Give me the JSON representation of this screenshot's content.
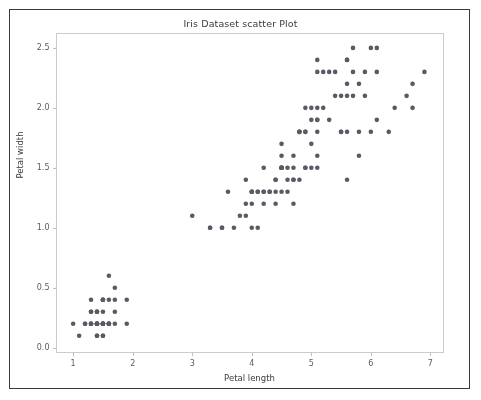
{
  "figure": {
    "title": "Iris Dataset scatter Plot",
    "background_color": "#ffffff",
    "frame_color": "#3a3a3a",
    "axes_spine_color": "#cccccc",
    "marker_color": "#5a5a64"
  },
  "chart_data": {
    "type": "scatter",
    "title": "Iris Dataset scatter Plot",
    "xlabel": "Petal length",
    "ylabel": "Petal width",
    "xlim": [
      0.72,
      7.22
    ],
    "ylim": [
      -0.04,
      2.62
    ],
    "xticks": [
      1,
      2,
      3,
      4,
      5,
      6,
      7
    ],
    "xtick_labels": [
      "1",
      "2",
      "3",
      "4",
      "5",
      "6",
      "7"
    ],
    "yticks": [
      0.0,
      0.5,
      1.0,
      1.5,
      2.0,
      2.5
    ],
    "ytick_labels": [
      "0.0",
      "0.5",
      "1.0",
      "1.5",
      "2.0",
      "2.5"
    ],
    "grid": false,
    "legend": null,
    "marker_color": "#5a5a64",
    "marker_size": 4.6,
    "n_points": 150,
    "x": [
      1.4,
      1.4,
      1.3,
      1.5,
      1.4,
      1.7,
      1.4,
      1.5,
      1.4,
      1.5,
      1.5,
      1.6,
      1.4,
      1.1,
      1.2,
      1.5,
      1.3,
      1.4,
      1.7,
      1.5,
      1.7,
      1.5,
      1.0,
      1.7,
      1.9,
      1.6,
      1.6,
      1.5,
      1.4,
      1.6,
      1.6,
      1.5,
      1.5,
      1.4,
      1.5,
      1.2,
      1.3,
      1.4,
      1.3,
      1.5,
      1.3,
      1.3,
      1.3,
      1.6,
      1.9,
      1.4,
      1.6,
      1.4,
      1.5,
      1.4,
      4.7,
      4.5,
      4.9,
      4.0,
      4.6,
      4.5,
      4.7,
      3.3,
      4.6,
      3.9,
      3.5,
      4.2,
      4.0,
      4.7,
      3.6,
      4.4,
      4.5,
      4.1,
      4.5,
      3.9,
      4.8,
      4.0,
      4.9,
      4.7,
      4.3,
      4.4,
      4.8,
      5.0,
      4.5,
      3.5,
      3.8,
      3.7,
      3.9,
      5.1,
      4.5,
      4.5,
      4.7,
      4.4,
      4.1,
      4.0,
      4.4,
      4.6,
      4.0,
      3.3,
      4.2,
      4.2,
      4.2,
      4.3,
      3.0,
      4.1,
      6.0,
      5.1,
      5.9,
      5.6,
      5.8,
      6.6,
      4.5,
      6.3,
      5.8,
      6.1,
      5.1,
      5.3,
      5.5,
      5.0,
      5.1,
      5.3,
      5.5,
      6.7,
      6.9,
      5.0,
      5.7,
      4.9,
      6.7,
      4.9,
      5.7,
      6.0,
      4.8,
      4.9,
      5.6,
      5.8,
      6.1,
      6.4,
      5.6,
      5.1,
      5.6,
      6.1,
      5.6,
      5.5,
      4.8,
      5.4,
      5.6,
      5.1,
      5.1,
      5.9,
      5.7,
      5.2,
      5.0,
      5.2,
      5.4,
      5.1
    ],
    "y": [
      0.2,
      0.2,
      0.2,
      0.2,
      0.2,
      0.4,
      0.3,
      0.2,
      0.2,
      0.1,
      0.2,
      0.2,
      0.1,
      0.1,
      0.2,
      0.4,
      0.4,
      0.3,
      0.3,
      0.3,
      0.2,
      0.4,
      0.2,
      0.5,
      0.2,
      0.2,
      0.4,
      0.2,
      0.2,
      0.2,
      0.2,
      0.4,
      0.1,
      0.2,
      0.2,
      0.2,
      0.2,
      0.1,
      0.2,
      0.2,
      0.3,
      0.3,
      0.2,
      0.6,
      0.4,
      0.3,
      0.2,
      0.2,
      0.2,
      0.2,
      1.4,
      1.5,
      1.5,
      1.3,
      1.5,
      1.3,
      1.6,
      1.0,
      1.3,
      1.4,
      1.0,
      1.5,
      1.0,
      1.4,
      1.3,
      1.4,
      1.5,
      1.0,
      1.5,
      1.1,
      1.8,
      1.3,
      1.5,
      1.2,
      1.3,
      1.4,
      1.4,
      1.7,
      1.5,
      1.0,
      1.1,
      1.0,
      1.2,
      1.6,
      1.5,
      1.6,
      1.5,
      1.3,
      1.3,
      1.3,
      1.2,
      1.4,
      1.2,
      1.0,
      1.3,
      1.2,
      1.3,
      1.3,
      1.1,
      1.3,
      2.5,
      1.9,
      2.1,
      1.8,
      2.2,
      2.1,
      1.7,
      1.8,
      1.8,
      2.5,
      2.0,
      1.9,
      2.1,
      2.0,
      2.4,
      2.3,
      1.8,
      2.2,
      2.3,
      1.5,
      2.3,
      2.0,
      2.0,
      1.8,
      2.1,
      1.8,
      1.8,
      1.8,
      2.1,
      1.6,
      1.9,
      2.0,
      2.2,
      1.5,
      1.4,
      2.3,
      2.4,
      1.8,
      1.8,
      2.1,
      2.4,
      2.3,
      1.9,
      2.3,
      2.5,
      2.3,
      1.9,
      2.0,
      2.3,
      1.8
    ]
  }
}
